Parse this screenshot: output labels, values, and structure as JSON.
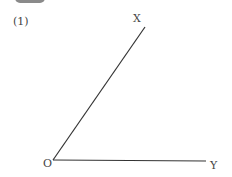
{
  "problem": {
    "number_label": "(1)"
  },
  "diagram": {
    "type": "angle",
    "vertex": {
      "label": "O",
      "x": 53,
      "y": 160
    },
    "ray_x": {
      "label": "X",
      "x1": 53,
      "y1": 160,
      "x2": 145,
      "y2": 27
    },
    "ray_y": {
      "label": "Y",
      "x1": 53,
      "y1": 160,
      "x2": 206,
      "y2": 161
    },
    "stroke_color": "#333333"
  }
}
